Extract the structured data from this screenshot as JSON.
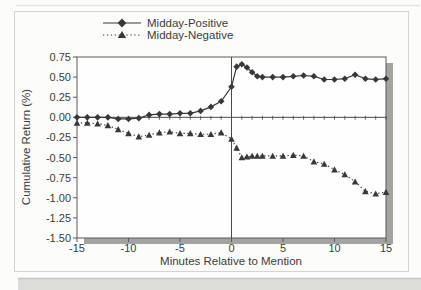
{
  "figure": {
    "background_color": "#fcfcfa",
    "frame_border_color": "#d4d4ce",
    "scan_strip_color": "#dcdcd8",
    "plot_shadow_color": "#a3a3a0",
    "plot_background": "#fefefe",
    "axis_color": "#5a5a5a",
    "text_color": "#3b3b3b"
  },
  "chart_data": {
    "type": "line",
    "title": "",
    "xlabel": "Minutes Relative to Mention",
    "ylabel": "Cumulative Return (%)",
    "xlim": [
      -15,
      15
    ],
    "ylim": [
      -1.5,
      0.75
    ],
    "x_ticks": [
      -15,
      -10,
      -5,
      0,
      5,
      10,
      15
    ],
    "y_ticks": [
      0.75,
      0.5,
      0.25,
      0,
      -0.25,
      -0.5,
      -0.75,
      -1,
      -1.25,
      -1.5
    ],
    "minor_x_tick_step": 1,
    "grid": false,
    "legend_position": "top-center",
    "event_line_x": 0,
    "zero_line": true,
    "x": [
      -15,
      -14,
      -13,
      -12,
      -11,
      -10,
      -9,
      -8,
      -7,
      -6,
      -5,
      -4,
      -3,
      -2,
      -1,
      0,
      0.5,
      1,
      1.5,
      2,
      2.5,
      3,
      4,
      5,
      6,
      7,
      8,
      9,
      10,
      11,
      12,
      13,
      14,
      15
    ],
    "series": [
      {
        "name": "Midday-Positive",
        "marker": "diamond",
        "line_style": "solid",
        "color": "#383838",
        "values": [
          0.0,
          0.0,
          0.0,
          0.0,
          -0.02,
          -0.02,
          -0.01,
          0.03,
          0.04,
          0.04,
          0.05,
          0.05,
          0.08,
          0.13,
          0.2,
          0.38,
          0.63,
          0.66,
          0.62,
          0.56,
          0.51,
          0.5,
          0.5,
          0.5,
          0.51,
          0.52,
          0.51,
          0.47,
          0.47,
          0.48,
          0.53,
          0.48,
          0.47,
          0.48
        ]
      },
      {
        "name": "Midday-Negative",
        "marker": "triangle",
        "line_style": "dotted",
        "color": "#383838",
        "values": [
          -0.07,
          -0.07,
          -0.08,
          -0.1,
          -0.15,
          -0.2,
          -0.24,
          -0.22,
          -0.19,
          -0.18,
          -0.2,
          -0.2,
          -0.21,
          -0.21,
          -0.19,
          -0.27,
          -0.38,
          -0.5,
          -0.49,
          -0.48,
          -0.48,
          -0.48,
          -0.48,
          -0.48,
          -0.47,
          -0.48,
          -0.55,
          -0.58,
          -0.65,
          -0.71,
          -0.8,
          -0.92,
          -0.95,
          -0.93
        ]
      }
    ]
  }
}
